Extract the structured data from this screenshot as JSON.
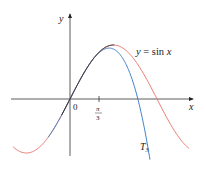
{
  "chart_data": {
    "type": "line",
    "title": "",
    "xlabel": "x",
    "ylabel": "y",
    "origin_label": "0",
    "ticks": [
      {
        "x": 1.0472,
        "label_num": "π",
        "label_den": "3"
      }
    ],
    "series": [
      {
        "name": "y = sin x",
        "label": "y = sin x",
        "color": "#e87a72",
        "function": "sin(x)",
        "domain": [
          -2.05,
          4.3
        ]
      },
      {
        "name": "T3",
        "label": "T",
        "label_sub": "3",
        "color": "#3f7fc9",
        "function": "x - x^3/6",
        "domain": [
          -0.78,
          3.1
        ]
      }
    ],
    "overlap_color": "#333333",
    "xlim": [
      -2.5,
      4.9
    ],
    "ylim": [
      -1.25,
      1.6
    ],
    "grid": false,
    "legend": "inline labels"
  },
  "labels": {
    "y_axis": "y",
    "x_axis": "x",
    "origin": "0",
    "tick_num": "π",
    "tick_den": "3",
    "sin_label": "y = sin x",
    "t3_main": "T",
    "t3_sub": "3"
  }
}
